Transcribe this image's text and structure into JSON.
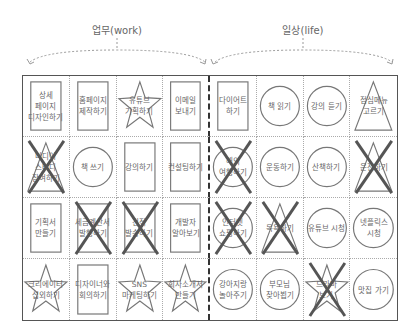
{
  "headers": {
    "work": "업무(work)",
    "life": "일상(life)"
  },
  "colors": {
    "line": "#555555",
    "shape_stroke": "#777777",
    "cross": "#555555",
    "text": "#666666"
  },
  "grid": {
    "rows": [
      [
        {
          "text": "상세\n페이지\n디자인하기",
          "shape": "rect",
          "crossed": false
        },
        {
          "text": "홈페이지\n제작하기",
          "shape": "rect",
          "crossed": false
        },
        {
          "text": "유튜브\n기획하기",
          "shape": "star",
          "crossed": false
        },
        {
          "text": "이메일\n보내기",
          "shape": "rect",
          "crossed": false
        },
        {
          "text": "다이어트\n하기",
          "shape": "rect",
          "crossed": false
        },
        {
          "text": "책 읽기",
          "shape": "circle",
          "crossed": false
        },
        {
          "text": "강의 듣기",
          "shape": "circle",
          "crossed": false
        },
        {
          "text": "점심메뉴\n고르기",
          "shape": "triangle",
          "crossed": false
        }
      ],
      [
        {
          "text": "미디어\n스터디\n참여하기",
          "shape": "triangle",
          "crossed": true
        },
        {
          "text": "책 쓰기",
          "shape": "circle",
          "crossed": false
        },
        {
          "text": "강의하기",
          "shape": "rect",
          "crossed": false
        },
        {
          "text": "컨설팅하기",
          "shape": "rect",
          "crossed": false
        },
        {
          "text": "해외\n여행하기",
          "shape": "circle",
          "crossed": true
        },
        {
          "text": "운동하기",
          "shape": "circle",
          "crossed": false
        },
        {
          "text": "산책하기",
          "shape": "circle",
          "crossed": false
        },
        {
          "text": "운전하기",
          "shape": "triangle",
          "crossed": true
        }
      ],
      [
        {
          "text": "기획서\n만들기",
          "shape": "rect",
          "crossed": false
        },
        {
          "text": "세금계산서\n발행하기",
          "shape": "rect",
          "crossed": true
        },
        {
          "text": "견적\n발송하기",
          "shape": "rect",
          "crossed": true
        },
        {
          "text": "개발자\n알아보기",
          "shape": "rect",
          "crossed": false
        },
        {
          "text": "인터넷\n쇼핑하기",
          "shape": "circle",
          "crossed": true
        },
        {
          "text": "목욕하기",
          "shape": "triangle",
          "crossed": true
        },
        {
          "text": "유튜브 시청",
          "shape": "circle",
          "crossed": false
        },
        {
          "text": "넷플릭스\n시청",
          "shape": "circle",
          "crossed": false
        }
      ],
      [
        {
          "text": "크리에이터\n섭외하기",
          "shape": "star",
          "crossed": false
        },
        {
          "text": "디자이너와\n회의하기",
          "shape": "rect",
          "crossed": false
        },
        {
          "text": "SNS\n마케팅하기",
          "shape": "star",
          "crossed": false
        },
        {
          "text": "회사소개서\n만들기",
          "shape": "star",
          "crossed": false
        },
        {
          "text": "강아지랑\n놀아주기",
          "shape": "circle",
          "crossed": false
        },
        {
          "text": "부모님\n찾아뵙기",
          "shape": "circle",
          "crossed": false
        },
        {
          "text": "드라마\n보기",
          "shape": "star",
          "crossed": true
        },
        {
          "text": "맛집 가기",
          "shape": "circle",
          "crossed": false
        }
      ]
    ]
  }
}
